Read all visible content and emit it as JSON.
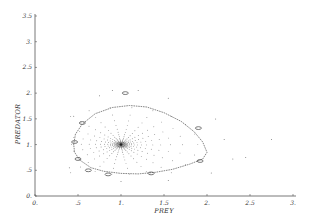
{
  "chart_data": {
    "type": "scatter",
    "title": "",
    "xlabel": "PREY",
    "ylabel": "PREDATOR",
    "xlim": [
      0,
      3
    ],
    "ylim": [
      0,
      3.5
    ],
    "grid": false,
    "legend": null,
    "x_ticks": [
      0,
      0.5,
      1,
      1.5,
      2,
      2.5,
      3
    ],
    "x_tick_labels": [
      "0.",
      ".5",
      "1.",
      "1.5",
      "2.",
      "2.5",
      "3."
    ],
    "y_ticks": [
      0,
      0.5,
      1,
      1.5,
      2,
      2.5,
      3,
      3.5
    ],
    "y_tick_labels": [
      "0.",
      ".5",
      "1.",
      "1.5",
      "2.",
      "2.5",
      "3.",
      "3.5"
    ],
    "fixed_point": {
      "x": 1.0,
      "y": 1.0
    },
    "series": [
      {
        "name": "outer-orbit",
        "points": [
          [
            0.45,
            1.0
          ],
          [
            0.47,
            1.2
          ],
          [
            0.55,
            1.4
          ],
          [
            0.7,
            1.6
          ],
          [
            0.9,
            1.72
          ],
          [
            1.1,
            1.76
          ],
          [
            1.3,
            1.73
          ],
          [
            1.5,
            1.62
          ],
          [
            1.7,
            1.45
          ],
          [
            1.85,
            1.25
          ],
          [
            1.95,
            1.05
          ],
          [
            2.0,
            0.85
          ],
          [
            1.95,
            0.72
          ],
          [
            1.8,
            0.62
          ],
          [
            1.6,
            0.52
          ],
          [
            1.4,
            0.46
          ],
          [
            1.2,
            0.43
          ],
          [
            1.0,
            0.44
          ],
          [
            0.8,
            0.48
          ],
          [
            0.65,
            0.55
          ],
          [
            0.52,
            0.7
          ],
          [
            0.46,
            0.85
          ]
        ]
      },
      {
        "name": "loop-markers",
        "points": [
          [
            1.05,
            2.0
          ],
          [
            1.9,
            1.32
          ],
          [
            0.55,
            1.42
          ],
          [
            0.46,
            1.05
          ],
          [
            0.5,
            0.72
          ],
          [
            0.62,
            0.5
          ],
          [
            0.85,
            0.42
          ],
          [
            1.35,
            0.44
          ],
          [
            1.92,
            0.68
          ]
        ]
      }
    ]
  }
}
